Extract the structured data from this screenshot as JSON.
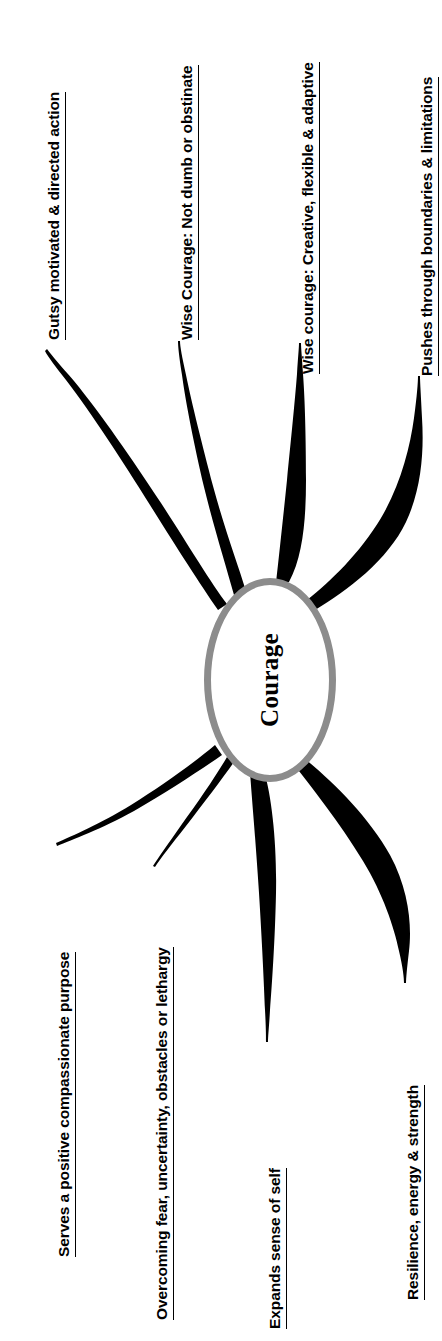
{
  "diagram": {
    "type": "mind-map",
    "title": "Courage",
    "center": {
      "label": "Courage",
      "shape": "ellipse",
      "border_color": "#8c8c8c",
      "fill_color": "#ffffff",
      "text_color": "#000000"
    },
    "branch_color": "#000000",
    "background_color": "#ffffff",
    "orientation": "rotated-90-ccw",
    "branches": [
      {
        "id": "gutsy",
        "label": "Gutsy motivated & directed action",
        "side": "left-top"
      },
      {
        "id": "wise-courage-not-dumb",
        "label": "Wise Courage: Not dumb or obstinate",
        "side": "left-top"
      },
      {
        "id": "wise-courage-creative",
        "label": "Wise courage: Creative, flexible & adaptive",
        "side": "right-top"
      },
      {
        "id": "pushes-through",
        "label": "Pushes through boundaries & limitations",
        "side": "right-top"
      },
      {
        "id": "serves-purpose",
        "label": "Serves a positive compassionate purpose",
        "side": "left-bottom"
      },
      {
        "id": "overcoming-fear",
        "label": "Overcoming fear, uncertainty, obstacles or lethargy",
        "side": "left-bottom"
      },
      {
        "id": "expands-self",
        "label": "Expands sense of self",
        "side": "right-bottom"
      },
      {
        "id": "resilience",
        "label": "Resilience, energy & strength",
        "side": "right-bottom"
      }
    ]
  }
}
